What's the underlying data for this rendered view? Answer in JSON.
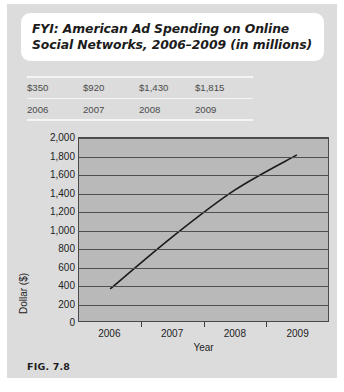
{
  "figure": {
    "title": "FYI:  American Ad Spending on Online Social Networks, 2006–2009 (in millions)",
    "caption": "FIG. 7.8"
  },
  "table": {
    "values": [
      "$350",
      "$920",
      "$1,430",
      "$1,815"
    ],
    "years": [
      "2006",
      "2007",
      "2008",
      "2009"
    ]
  },
  "chart_data": {
    "type": "line",
    "title": "FYI:  American Ad Spending on Online Social Networks, 2006–2009 (in millions)",
    "xlabel": "Year",
    "ylabel": "Dollar ($)",
    "categories": [
      "2006",
      "2007",
      "2008",
      "2009"
    ],
    "values": [
      350,
      920,
      1430,
      1815
    ],
    "value_labels": [
      "$350",
      "$920",
      "$1,430",
      "$1,815"
    ],
    "ylim": [
      0,
      2000
    ],
    "ytick_step": 200,
    "yticks": [
      "0",
      "200",
      "400",
      "600",
      "800",
      "1,000",
      "1,200",
      "1,400",
      "1,600",
      "1,800",
      "2,000"
    ],
    "xticks": [
      "2006",
      "2007",
      "2008",
      "2009"
    ],
    "grid": true,
    "legend": false,
    "plot_bg_color": "#b9b9b9",
    "line_color": "#1a1a1a",
    "gridline_color": "#4f4f4f"
  }
}
